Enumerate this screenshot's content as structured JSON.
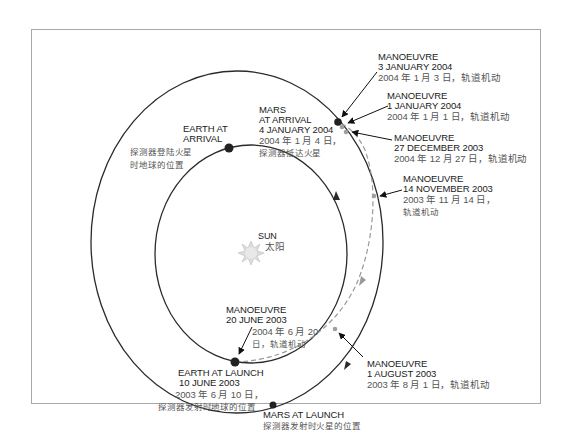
{
  "diagram": {
    "type": "orbital-transfer-diagram",
    "colors": {
      "orbit_line": "#2a2a2a",
      "transfer_path": "#9a9a9a",
      "planet_dot": "#222222",
      "manoeuvre_dot": "#a0a0a0",
      "sun": "#d8d8d8",
      "frame": "#a8a8a8",
      "label_en": "#1a1a1a",
      "label_zh": "#555555"
    },
    "sun": {
      "en": "SUN",
      "zh": "太阳"
    },
    "earth_at_arrival": {
      "en_line1": "EARTH AT",
      "en_line2": "ARRIVAL",
      "zh_line1": "探测器登陆火星",
      "zh_line2": "时地球的位置"
    },
    "mars_at_arrival": {
      "en_line1": "MARS",
      "en_line2": "AT ARRIVAL",
      "en_line3": "4 JANUARY 2004",
      "zh_line1": "2004 年 1 月 4 日，",
      "zh_line2": "探测器抵达火星"
    },
    "earth_at_launch": {
      "en_line1": "EARTH AT LAUNCH",
      "en_line2": "10 JUNE 2003",
      "zh_line1": "2003 年 6 月 10 日，",
      "zh_line2": "探测器发射时地球的位置"
    },
    "mars_at_launch": {
      "en_line1": "MARS AT LAUNCH",
      "zh_line1": "探测器发射时火星的位置"
    },
    "manoeuvres": [
      {
        "en_line1": "MANOEUVRE",
        "en_line2": "3 JANUARY 2004",
        "zh_line1": "2004 年 1 月 3 日，轨道机动"
      },
      {
        "en_line1": "MANOEUVRE",
        "en_line2": "1 JANUARY 2004",
        "zh_line1": "2004 年 1 月 1 日，轨道机动"
      },
      {
        "en_line1": "MANOEUVRE",
        "en_line2": "27 DECEMBER 2003",
        "zh_line1": "2004 年 12 月 27 日，轨道机动"
      },
      {
        "en_line1": "MANOEUVRE",
        "en_line2": "14 NOVEMBER 2003",
        "zh_line1": "2003 年 11 月 14 日，",
        "zh_line2": "轨道机动"
      },
      {
        "en_line1": "MANOEUVRE",
        "en_line2": "20 JUNE 2003",
        "zh_line1": "2004 年 6 月 20",
        "zh_line2": "日，轨道机动"
      },
      {
        "en_line1": "MANOEUVRE",
        "en_line2": "1 AUGUST 2003",
        "zh_line1": "2003 年 8 月 1 日，轨道机动"
      }
    ]
  }
}
